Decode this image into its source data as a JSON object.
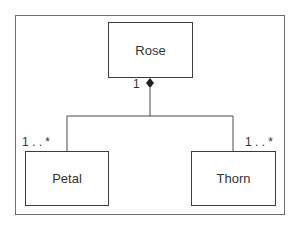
{
  "diagram": {
    "type": "UML class diagram (composition)",
    "classes": [
      {
        "id": "rose",
        "label": "Rose"
      },
      {
        "id": "petal",
        "label": "Petal"
      },
      {
        "id": "thorn",
        "label": "Thorn"
      }
    ],
    "relationships": [
      {
        "type": "composition",
        "whole": "rose",
        "part": "petal",
        "whole_multiplicity": "1",
        "part_multiplicity": "1 . . *"
      },
      {
        "type": "composition",
        "whole": "rose",
        "part": "thorn",
        "whole_multiplicity": "1",
        "part_multiplicity": "1 . . *"
      }
    ],
    "labels": {
      "rose_multiplicity": "1",
      "petal_multiplicity": "1 . . *",
      "thorn_multiplicity": "1 . . *"
    },
    "colors": {
      "line": "#4a4a4a",
      "frame": "#6e6e6e",
      "background": "#ffffff"
    }
  }
}
